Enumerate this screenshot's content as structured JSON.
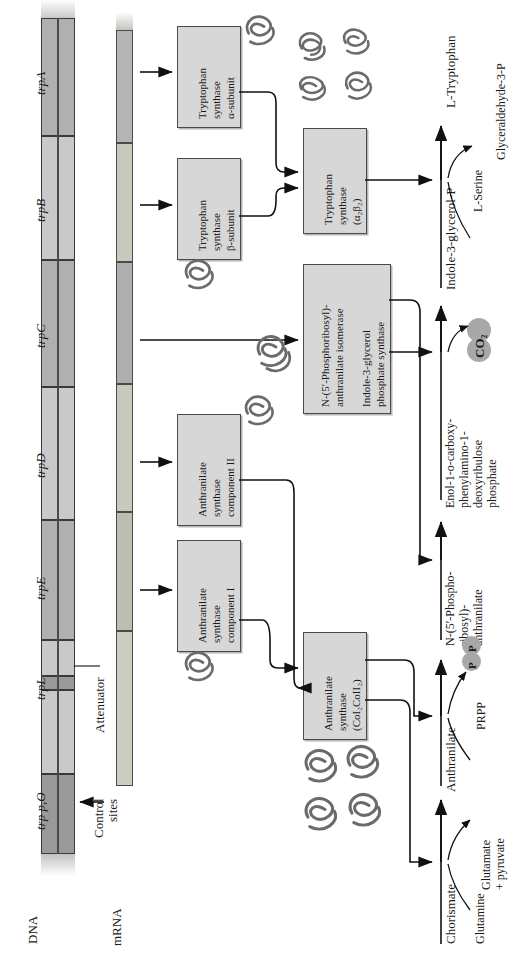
{
  "figure": {
    "orientation": "rotated-90",
    "accent_box_fill": "#d7d7d7",
    "accent_stroke": "#4a4a4a",
    "blob_fill": "#a8a8a8"
  },
  "dna": {
    "axis_label": "DNA",
    "control_label_line1": "Control",
    "control_label_line2": "sites",
    "attenuator_label": "Attenuator",
    "genes": [
      {
        "id": "trp-pO",
        "label": "trp p,O",
        "shade": "dark"
      },
      {
        "id": "trpL",
        "label": "trpL",
        "shade": "light"
      },
      {
        "id": "trpE",
        "label": "trpE",
        "shade": "mid"
      },
      {
        "id": "trpD",
        "label": "trpD",
        "shade": "light"
      },
      {
        "id": "trpC",
        "label": "trpC",
        "shade": "mid"
      },
      {
        "id": "trpB",
        "label": "trpB",
        "shade": "light"
      },
      {
        "id": "trpA",
        "label": "trpA",
        "shade": "mid"
      }
    ]
  },
  "mrna": {
    "axis_label": "mRNA"
  },
  "polypeptides": [
    {
      "id": "trpE-product",
      "lines": [
        "Anthranilate",
        "synthase",
        "component I"
      ]
    },
    {
      "id": "trpD-product",
      "lines": [
        "Anthranilate",
        "synthase",
        "component II"
      ]
    },
    {
      "id": "trpB-product",
      "lines": [
        "Tryptophan",
        "synthase",
        "β-subunit"
      ]
    },
    {
      "id": "trpA-product",
      "lines": [
        "Tryptophan",
        "synthase",
        "α-subunit"
      ]
    }
  ],
  "enzymes": [
    {
      "id": "anthranilate-synthase-complex",
      "lines": [
        "Anthranilate",
        "synthase",
        "(CoI₂CoII₂)"
      ]
    },
    {
      "id": "trpc-bifunctional",
      "lines": [
        "N-(5′-Phosphoribosyl)-",
        "anthranilate isomerase",
        "",
        "Indole-3-glycerol",
        "phosphate synthase"
      ]
    },
    {
      "id": "tryptophan-synthase-complex",
      "lines": [
        "Tryptophan",
        "synthase",
        "(α₂β₂)"
      ]
    }
  ],
  "pathway": {
    "metabolites": [
      {
        "id": "chorismate",
        "label": "Chorismate"
      },
      {
        "id": "anthranilate",
        "label": "Anthranilate"
      },
      {
        "id": "prib-anthranilate",
        "lines": [
          "N-(5′-Phospho-",
          "ribosyl)-",
          "anthranilate"
        ]
      },
      {
        "id": "cdrp",
        "lines": [
          "Enol-1-o-carboxy-",
          "phenylamino-1-",
          "deoxyribulose",
          "phosphate"
        ]
      },
      {
        "id": "indole-3-glycerol-p",
        "label": "Indole-3-glycerol-P"
      },
      {
        "id": "l-tryptophan",
        "label": "L-Tryptophan"
      }
    ],
    "cosubstrates": [
      {
        "id": "glutamine",
        "label": "Glutamine"
      },
      {
        "id": "prpp",
        "label": "PRPP"
      },
      {
        "id": "l-serine",
        "label": "L-Serine"
      }
    ],
    "coproducts": [
      {
        "id": "glutamate-pyruvate",
        "lines": [
          "Glutamate",
          "+ pyruvate"
        ]
      },
      {
        "id": "pyrophosphate",
        "label_a": "P",
        "label_b": "P"
      },
      {
        "id": "carbon-dioxide",
        "label": "CO₂"
      },
      {
        "id": "glyceraldehyde-3-p",
        "label": "Glyceraldehyde-3-P"
      }
    ]
  }
}
